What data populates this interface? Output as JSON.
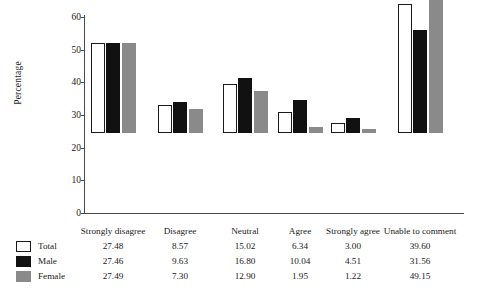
{
  "chart_data": {
    "type": "bar",
    "title": "",
    "xlabel": "",
    "ylabel": "Percentage",
    "ylim": [
      0,
      60
    ],
    "yticks": [
      0,
      10,
      20,
      30,
      40,
      50,
      60
    ],
    "grid": false,
    "legend_position": "bottom-left",
    "categories": [
      "Strongly disagree",
      "Disagree",
      "Neutral",
      "Agree",
      "Strongly agree",
      "Unable to comment"
    ],
    "series": [
      {
        "name": "Total",
        "color": "#ffffff",
        "values": [
          27.48,
          8.57,
          15.02,
          6.34,
          3.0,
          39.6
        ]
      },
      {
        "name": "Male",
        "color": "#111111",
        "values": [
          27.46,
          9.63,
          16.8,
          10.04,
          4.51,
          31.56
        ]
      },
      {
        "name": "Female",
        "color": "#8a8a8a",
        "values": [
          27.49,
          7.3,
          12.9,
          1.95,
          1.22,
          49.15
        ]
      }
    ],
    "value_labels": {
      "Total": [
        "27.48",
        "8.57",
        "15.02",
        "6.34",
        "3.00",
        "39.60"
      ],
      "Male": [
        "27.46",
        "9.63",
        "16.80",
        "10.04",
        "4.51",
        "31.56"
      ],
      "Female": [
        "27.49",
        "7.30",
        "12.90",
        "1.95",
        "1.22",
        "49.15"
      ]
    }
  },
  "axis": {
    "y_title": "Percentage",
    "y_ticks": [
      "0",
      "10",
      "20",
      "30",
      "40",
      "50",
      "60"
    ]
  },
  "legend": {
    "items": [
      {
        "label": "Total",
        "swatch": "total"
      },
      {
        "label": "Male",
        "swatch": "male"
      },
      {
        "label": "Female",
        "swatch": "female"
      }
    ]
  }
}
